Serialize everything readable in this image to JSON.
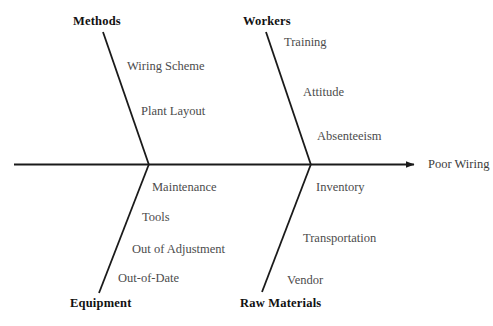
{
  "diagram": {
    "type": "fishbone-ishikawa",
    "effect": {
      "label": "Poor Wiring"
    },
    "colors": {
      "background": "#ffffff",
      "spine": "#1a1a1a",
      "bone": "#1a1a1a",
      "category_text": "#111111",
      "cause_text": "#4c4c4c",
      "effect_text": "#3d3d3d"
    },
    "branches": [
      {
        "id": "methods",
        "label": "Methods",
        "position": "top-left",
        "causes": [
          {
            "label": "Wiring Scheme"
          },
          {
            "label": "Plant Layout"
          }
        ]
      },
      {
        "id": "workers",
        "label": "Workers",
        "position": "top-right",
        "causes": [
          {
            "label": "Training"
          },
          {
            "label": "Attitude"
          },
          {
            "label": "Absenteeism"
          }
        ]
      },
      {
        "id": "equipment",
        "label": "Equipment",
        "position": "bottom-left",
        "causes": [
          {
            "label": "Maintenance"
          },
          {
            "label": "Tools"
          },
          {
            "label": "Out of Adjustment"
          },
          {
            "label": "Out-of-Date"
          }
        ]
      },
      {
        "id": "raw-materials",
        "label": "Raw Materials",
        "position": "bottom-right",
        "causes": [
          {
            "label": "Inventory"
          },
          {
            "label": "Transportation"
          },
          {
            "label": "Vendor"
          }
        ]
      }
    ]
  }
}
